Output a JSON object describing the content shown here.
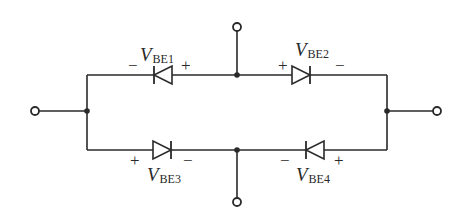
{
  "diagram": {
    "type": "circuit",
    "colors": {
      "stroke": "#2a2a2a",
      "background": "#ffffff"
    },
    "diodes": [
      {
        "id": "d1",
        "label_main": "V",
        "label_sub": "BE1",
        "left_sign": "−",
        "right_sign": "+",
        "direction": "left"
      },
      {
        "id": "d2",
        "label_main": "V",
        "label_sub": "BE2",
        "left_sign": "+",
        "right_sign": "−",
        "direction": "right"
      },
      {
        "id": "d3",
        "label_main": "V",
        "label_sub": "BE3",
        "left_sign": "+",
        "right_sign": "−",
        "direction": "right"
      },
      {
        "id": "d4",
        "label_main": "V",
        "label_sub": "BE4",
        "left_sign": "−",
        "right_sign": "+",
        "direction": "left"
      }
    ],
    "terminals": [
      "left",
      "right",
      "top",
      "bottom"
    ]
  }
}
